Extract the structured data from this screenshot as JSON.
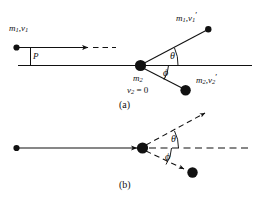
{
  "figure": {
    "background_color": "#ffffff",
    "stroke_color": "#111111",
    "width": 259,
    "height": 204,
    "panels": [
      {
        "id": "a",
        "caption": "(a)",
        "labels": {
          "incoming": "m₁,v₁",
          "impact_parameter": "P",
          "target_mass": "m₂",
          "target_velocity": "v₂ = 0",
          "outgoing_upper": "m₁,v₁′",
          "outgoing_lower": "m₂,v₂′",
          "angle_upper": "θ",
          "angle_lower": "ϕ"
        }
      },
      {
        "id": "b",
        "caption": "(b)",
        "labels": {
          "angle_upper": "θ",
          "angle_lower": "ϕ"
        }
      }
    ],
    "symbols": {
      "m": "m",
      "v": "v",
      "one": "1",
      "two": "2",
      "prime": "′",
      "equals_zero": "= 0",
      "theta": "θ",
      "phi": "ϕ",
      "P": "P",
      "caption_a": "(a)",
      "caption_b": "(b)"
    }
  }
}
